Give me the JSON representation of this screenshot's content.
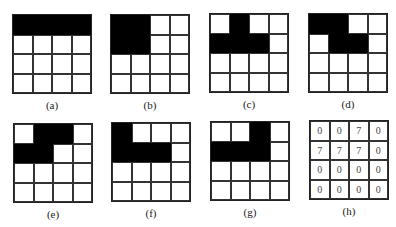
{
  "figure": {
    "panels": [
      {
        "id": "a",
        "label": "(a)",
        "x": 12,
        "y": 14,
        "cells": [
          [
            1,
            1,
            1,
            1
          ],
          [
            0,
            0,
            0,
            0
          ],
          [
            0,
            0,
            0,
            0
          ],
          [
            0,
            0,
            0,
            0
          ]
        ]
      },
      {
        "id": "b",
        "label": "(b)",
        "x": 110,
        "y": 14,
        "cells": [
          [
            1,
            1,
            0,
            0
          ],
          [
            1,
            1,
            0,
            0
          ],
          [
            0,
            0,
            0,
            0
          ],
          [
            0,
            0,
            0,
            0
          ]
        ]
      },
      {
        "id": "c",
        "label": "(c)",
        "x": 209,
        "y": 13,
        "cells": [
          [
            0,
            1,
            0,
            0
          ],
          [
            1,
            1,
            1,
            0
          ],
          [
            0,
            0,
            0,
            0
          ],
          [
            0,
            0,
            0,
            0
          ]
        ]
      },
      {
        "id": "d",
        "label": "(d)",
        "x": 308,
        "y": 13,
        "cells": [
          [
            1,
            1,
            0,
            0
          ],
          [
            0,
            1,
            1,
            0
          ],
          [
            0,
            0,
            0,
            0
          ],
          [
            0,
            0,
            0,
            0
          ]
        ]
      },
      {
        "id": "e",
        "label": "(e)",
        "x": 13,
        "y": 123,
        "cells": [
          [
            0,
            1,
            1,
            0
          ],
          [
            1,
            1,
            0,
            0
          ],
          [
            0,
            0,
            0,
            0
          ],
          [
            0,
            0,
            0,
            0
          ]
        ]
      },
      {
        "id": "f",
        "label": "(f)",
        "x": 111,
        "y": 122,
        "cells": [
          [
            1,
            0,
            0,
            0
          ],
          [
            1,
            1,
            1,
            0
          ],
          [
            0,
            0,
            0,
            0
          ],
          [
            0,
            0,
            0,
            0
          ]
        ]
      },
      {
        "id": "g",
        "label": "(g)",
        "x": 210,
        "y": 121,
        "cells": [
          [
            0,
            0,
            1,
            0
          ],
          [
            1,
            1,
            1,
            0
          ],
          [
            0,
            0,
            0,
            0
          ],
          [
            0,
            0,
            0,
            0
          ]
        ]
      },
      {
        "id": "h",
        "label": "(h)",
        "x": 309,
        "y": 120,
        "values": [
          [
            "0",
            "0",
            "7",
            "0"
          ],
          [
            "7",
            "7",
            "7",
            "0"
          ],
          [
            "0",
            "0",
            "0",
            "0"
          ],
          [
            "0",
            "0",
            "0",
            "0"
          ]
        ]
      }
    ]
  }
}
